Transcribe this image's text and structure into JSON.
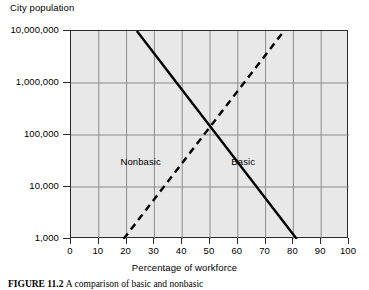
{
  "figure": {
    "y_axis_title": "City population",
    "x_axis_title": "Percentage of workforce",
    "caption_label": "FIGURE 11.2",
    "caption_body": "A comparison of basic and nonbasic"
  },
  "chart_data": {
    "type": "line",
    "title": "",
    "xlabel": "Percentage of workforce",
    "ylabel": "City population",
    "xlim": [
      0,
      100
    ],
    "ylim": [
      1000,
      10000000
    ],
    "yscale": "log",
    "grid": true,
    "legend_position": "inline-annotation",
    "xticks": [
      0,
      10,
      20,
      30,
      40,
      50,
      60,
      70,
      80,
      90,
      100
    ],
    "xtick_labels": [
      "0",
      "10",
      "20",
      "30",
      "40",
      "50",
      "60",
      "70",
      "80",
      "90",
      "100"
    ],
    "yticks": [
      1000,
      10000,
      100000,
      1000000,
      10000000
    ],
    "ytick_labels": [
      "1,000",
      "10,000",
      "100,000",
      "1,000,000",
      "10,000,000"
    ],
    "series": [
      {
        "name": "Basic",
        "style": "solid",
        "color": "#000000",
        "x": [
          23.7,
          81.2
        ],
        "y": [
          10000000,
          1000
        ],
        "annotation": "Basic",
        "annotation_x": 62,
        "annotation_y": 30000
      },
      {
        "name": "Nonbasic",
        "style": "dashed",
        "color": "#000000",
        "x": [
          18.9,
          76.6
        ],
        "y": [
          1000,
          10000000
        ],
        "annotation": "Nonbasic",
        "annotation_x": 25,
        "annotation_y": 30000
      }
    ],
    "intersection": {
      "x": 50,
      "y": 80000
    },
    "colors": {
      "plot_background": "#e8e8e8",
      "gridline": "#8c8c8c",
      "axis": "#2b2b2b",
      "line": "#000000",
      "page_background": "#ffffff"
    }
  }
}
